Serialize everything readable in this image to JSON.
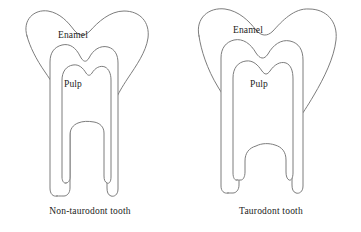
{
  "figure": {
    "kind": "anatomical-line-diagram",
    "background_color": "#ffffff",
    "stroke_color": "#7d7d7d",
    "text_color": "#1b1b1b"
  },
  "teeth": [
    {
      "id": "non-taurodont",
      "caption": "Non-taurodont tooth",
      "labels": {
        "enamel": "Enamel",
        "pulp": "Pulp"
      },
      "description": "Normal molar: short crown-to-root pulp chamber, long divergent roots with root canals beginning high near the crown"
    },
    {
      "id": "taurodont",
      "caption": "Taurodont tooth",
      "labels": {
        "enamel": "Enamel",
        "pulp": "Pulp"
      },
      "description": "Taurodont molar: enlarged elongated pulp chamber extending apically into the root trunk, short stubby root canals and shorter roots"
    }
  ]
}
